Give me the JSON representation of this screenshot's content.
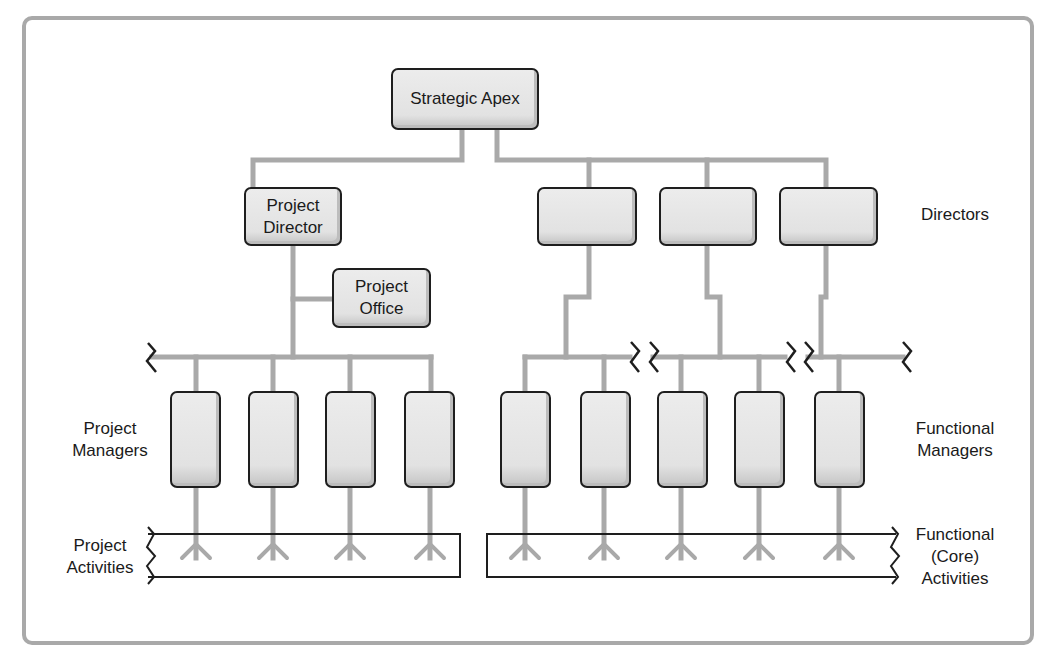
{
  "diagram": {
    "title_node": "Strategic Apex",
    "project_director": {
      "line1": "Project",
      "line2": "Director"
    },
    "project_office": {
      "line1": "Project",
      "line2": "Office"
    },
    "director_boxes_count": 3,
    "project_manager_boxes_count": 4,
    "functional_manager_boxes_count": 5,
    "labels": {
      "directors": "Directors",
      "project_managers": {
        "line1": "Project",
        "line2": "Managers"
      },
      "functional_managers": {
        "line1": "Functional",
        "line2": "Managers"
      },
      "project_activities": {
        "line1": "Project",
        "line2": "Activities"
      },
      "functional_activities": {
        "line1": "Functional",
        "line2": "(Core)",
        "line3": "Activities"
      }
    },
    "colors": {
      "connector": "#a9a9a9",
      "box_border": "#1e1e1e",
      "box_fill": "#e6e6e6",
      "frame": "#a9a9a9",
      "text": "#1a1a1a"
    }
  }
}
